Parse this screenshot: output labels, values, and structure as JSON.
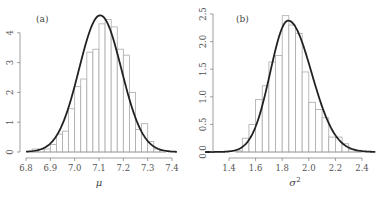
{
  "chart_data": [
    {
      "type": "bar",
      "panel": "(a)",
      "title": "",
      "xlabel": "μ",
      "ylabel": "",
      "xlim": [
        6.8,
        7.4
      ],
      "ylim": [
        0,
        4.6
      ],
      "xticks": [
        "6.8",
        "6.9",
        "7.0",
        "7.1",
        "7.2",
        "7.3",
        "7.4"
      ],
      "yticks": [
        "0",
        "1",
        "2",
        "3",
        "4"
      ],
      "grid": false,
      "bin_width": 0.025,
      "bins_start": [
        6.825,
        6.85,
        6.875,
        6.9,
        6.925,
        6.95,
        6.975,
        7.0,
        7.025,
        7.05,
        7.075,
        7.1,
        7.125,
        7.15,
        7.175,
        7.2,
        7.225,
        7.25,
        7.275,
        7.3,
        7.325,
        7.35
      ],
      "values": [
        0.1,
        0.1,
        0.1,
        0.25,
        0.6,
        0.7,
        1.45,
        2.2,
        2.45,
        3.35,
        3.45,
        4.3,
        4.45,
        4.2,
        3.45,
        3.25,
        2.0,
        0.75,
        0.95,
        0.35,
        0.1,
        0.05
      ],
      "curve": {
        "type": "normal_density",
        "mean": 7.105,
        "sd": 0.087,
        "label": "fitted density"
      },
      "series_style": {
        "bars": "#aaaaaa",
        "curve": "#222222"
      }
    },
    {
      "type": "bar",
      "panel": "(b)",
      "title": "",
      "xlabel": "σ²",
      "ylabel": "",
      "xlim": [
        1.4,
        2.5
      ],
      "ylim": [
        0,
        2.5
      ],
      "xticks": [
        "1.4",
        "1.6",
        "1.8",
        "2.0",
        "2.2",
        "2.4"
      ],
      "yticks": [
        "0.0",
        "0.5",
        "1.0",
        "1.5",
        "2.0",
        "2.5"
      ],
      "grid": false,
      "bin_width": 0.05,
      "bins_start": [
        1.45,
        1.5,
        1.55,
        1.6,
        1.65,
        1.7,
        1.75,
        1.8,
        1.85,
        1.9,
        1.95,
        2.0,
        2.05,
        2.1,
        2.15,
        2.2,
        2.25,
        2.3,
        2.35
      ],
      "values": [
        0.02,
        0.25,
        0.5,
        0.95,
        1.2,
        1.63,
        1.75,
        2.47,
        2.3,
        2.15,
        1.45,
        0.9,
        0.77,
        0.62,
        0.27,
        0.27,
        0.15,
        0.05,
        0.02
      ],
      "curve": {
        "type": "skewed_density",
        "mode": 1.845,
        "peak": 2.38,
        "label": "fitted density"
      },
      "series_style": {
        "bars": "#aaaaaa",
        "curve": "#222222"
      }
    }
  ],
  "panels": {
    "a": {
      "label": "(a)",
      "xlabel": "μ"
    },
    "b": {
      "label": "(b)",
      "xlabel": "σ",
      "xlabel_sup": "2"
    }
  }
}
